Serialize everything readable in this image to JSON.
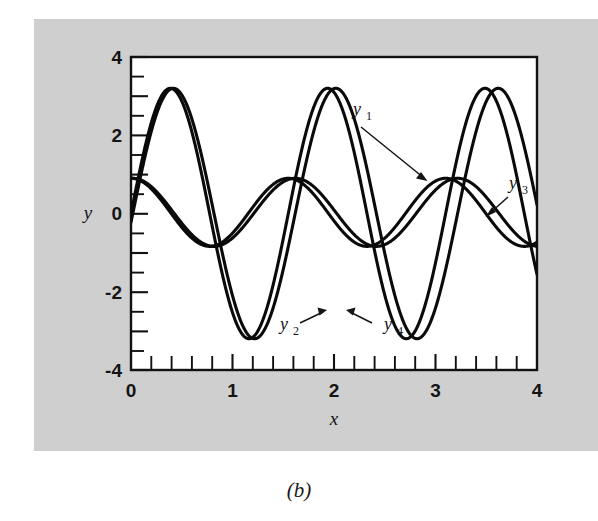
{
  "figure": {
    "caption": "(b)",
    "background_color": "#cfcfcf",
    "plot_background_color": "#ffffff",
    "line_color": "#0a0a0a"
  },
  "axes": {
    "x_label": "x",
    "y_label": "y",
    "x_tick_labels": [
      "0",
      "1",
      "2",
      "3",
      "4"
    ],
    "y_tick_labels": [
      "-4",
      "-2",
      "0",
      "2",
      "4"
    ]
  },
  "annotations": [
    {
      "name": "y1",
      "base": "y",
      "sub": "1",
      "x": 364,
      "y": 112
    },
    {
      "name": "y3",
      "base": "y",
      "sub": "3",
      "x": 494,
      "y": 158
    },
    {
      "name": "y2",
      "base": "y",
      "sub": "2",
      "x": 268,
      "y": 325
    },
    {
      "name": "y4",
      "base": "y",
      "sub": "4",
      "x": 382,
      "y": 325
    }
  ],
  "chart_data": {
    "type": "line",
    "title": "",
    "xlabel": "x",
    "ylabel": "y",
    "xlim": [
      0,
      4
    ],
    "ylim": [
      -4,
      4
    ],
    "xticks": [
      0,
      1,
      2,
      3,
      4
    ],
    "yticks": [
      -4,
      -2,
      0,
      2,
      4
    ],
    "x_minor_tick_step": 0.2,
    "y_minor_tick_step": 0.5,
    "grid": false,
    "legend": "inline annotations with leader arrows",
    "series": [
      {
        "name": "y1",
        "label": "y1",
        "description": "large amplitude oscillation, starts near 0 and dips first",
        "amplitude": 3.2,
        "period": 1.55,
        "phase_deg": 0,
        "offset": 0,
        "start_value": 0.0
      },
      {
        "name": "y2",
        "label": "y2",
        "description": "large amplitude oscillation nearly overlapping y1, slight phase lag growing with x",
        "amplitude": 3.2,
        "period": 1.6,
        "phase_deg": -4,
        "offset": 0,
        "start_value": 0.0
      },
      {
        "name": "y3",
        "label": "y3",
        "description": "small amplitude oscillation starting near 0.85",
        "amplitude": 0.87,
        "period": 1.55,
        "phase_deg": 90,
        "offset": 0.03,
        "start_value": 0.85
      },
      {
        "name": "y4",
        "label": "y4",
        "description": "small amplitude oscillation nearly overlapping y3, slight phase lag growing with x",
        "amplitude": 0.87,
        "period": 1.6,
        "phase_deg": 86,
        "offset": 0.03,
        "start_value": 0.85
      }
    ],
    "sampled_points": {
      "x": [
        0,
        0.2,
        0.4,
        0.6,
        0.8,
        1.0,
        1.2,
        1.4,
        1.6,
        1.8,
        2.0,
        2.2,
        2.4,
        2.6,
        2.8,
        3.0,
        3.2,
        3.4,
        3.6,
        3.8,
        4.0
      ],
      "y1": [
        0.0,
        -2.1,
        -3.15,
        -2.3,
        -0.2,
        2.2,
        3.2,
        2.3,
        0.1,
        -2.2,
        -3.15,
        -2.2,
        0.1,
        2.3,
        3.2,
        2.1,
        -0.2,
        -2.3,
        -3.15,
        -2.1,
        0.9
      ],
      "y2": [
        0.0,
        -2.0,
        -3.1,
        -2.45,
        -0.5,
        1.9,
        3.15,
        2.55,
        0.5,
        -1.9,
        -3.15,
        -2.5,
        -0.4,
        2.0,
        3.15,
        2.5,
        0.4,
        -2.0,
        -3.1,
        -2.6,
        -0.6
      ],
      "y3": [
        0.85,
        0.6,
        0.1,
        -0.5,
        -0.78,
        -0.45,
        0.25,
        0.75,
        0.9,
        0.55,
        -0.1,
        -0.6,
        -0.78,
        -0.4,
        0.3,
        0.8,
        0.9,
        0.5,
        -0.15,
        -0.6,
        -0.7
      ],
      "y4": [
        0.85,
        0.62,
        0.15,
        -0.42,
        -0.75,
        -0.55,
        0.1,
        0.65,
        0.88,
        0.65,
        0.0,
        -0.55,
        -0.78,
        -0.5,
        0.2,
        0.72,
        0.9,
        0.6,
        -0.05,
        -0.55,
        -0.72
      ]
    }
  }
}
